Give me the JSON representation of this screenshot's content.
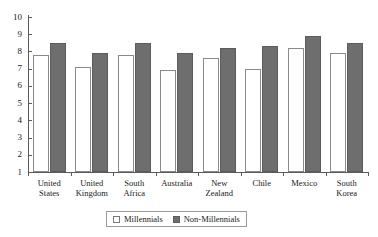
{
  "chart_data": {
    "type": "bar",
    "title": "",
    "subtitle": "",
    "xlabel": "",
    "ylabel": "",
    "ylim": [
      1,
      10
    ],
    "yticks": [
      1,
      2,
      3,
      4,
      5,
      6,
      7,
      8,
      9,
      10
    ],
    "grid": false,
    "legend_position": "bottom-center",
    "categories": [
      "United States",
      "United Kingdom",
      "South Africa",
      "Australia",
      "New Zealand",
      "Chile",
      "Mexico",
      "South Korea"
    ],
    "category_lines": [
      [
        "United",
        "States"
      ],
      [
        "United",
        "Kingdom"
      ],
      [
        "South",
        "Africa"
      ],
      [
        "Australia"
      ],
      [
        "New",
        "Zealand"
      ],
      [
        "Chile"
      ],
      [
        "Mexico"
      ],
      [
        "South",
        "Korea"
      ]
    ],
    "series": [
      {
        "name": "Millennials",
        "color": "#ffffff",
        "edge_color": "#8a8a8a",
        "values": [
          7.8,
          7.1,
          7.8,
          6.9,
          7.6,
          7.0,
          8.2,
          7.9
        ]
      },
      {
        "name": "Non-Millennials",
        "color": "#6e6e6e",
        "edge_color": "#5c5c5c",
        "values": [
          8.5,
          7.9,
          8.5,
          7.9,
          8.2,
          8.3,
          8.9,
          8.5
        ]
      }
    ]
  },
  "legend": {
    "entries": [
      {
        "label": "Millennials",
        "swatch": "light"
      },
      {
        "label": "Non-Millennials",
        "swatch": "dark"
      }
    ]
  },
  "axis": {
    "y_tick_labels": [
      "1",
      "2",
      "3",
      "4",
      "5",
      "6",
      "7",
      "8",
      "9",
      "10"
    ]
  }
}
